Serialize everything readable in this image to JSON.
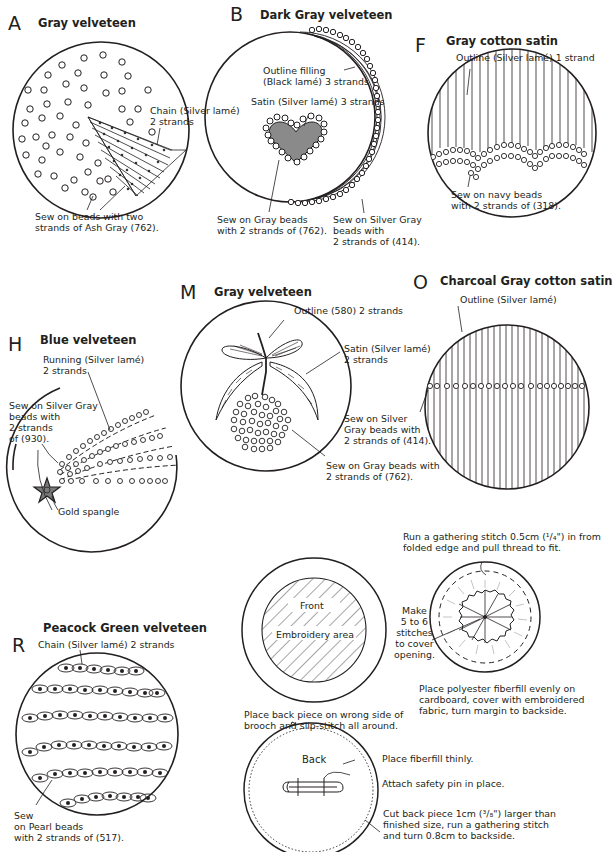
{
  "panels": {
    "A": {
      "letter": "A",
      "fabric": "Gray velveteen",
      "labels": {
        "chain": "Chain (Silver lamé)\n2 strands",
        "beads": "Sew on beads with two\nstrands of Ash Gray (762)."
      }
    },
    "B": {
      "letter": "B",
      "fabric": "Dark Gray velveteen",
      "labels": {
        "outline_filling": "Outline filling\n(Black lamé) 3 strands",
        "satin": "Satin (Silver lamé) 3 strands",
        "gray_beads": "Sew on Gray beads\nwith 2 strands of (762).",
        "silver_beads": "Sew on Silver Gray\nbeads with\n2 strands of (414)."
      }
    },
    "F": {
      "letter": "F",
      "fabric": "Gray cotton satin",
      "labels": {
        "outline": "Outline (Silver lamé) 1 strand",
        "beads": "Sew on navy beads\nwith 2 strands of (318)."
      }
    },
    "H": {
      "letter": "H",
      "fabric": "Blue velveteen",
      "labels": {
        "running": "Running (Silver lamé)\n2 strands",
        "beads": "Sew on Silver Gray\nbeads with\n2 strands\nof (930).",
        "spangle": "Gold spangle"
      }
    },
    "M": {
      "letter": "M",
      "fabric": "Gray velveteen",
      "labels": {
        "outline": "Outline (580) 2 strands",
        "satin": "Satin (Silver lamé)\n2 strands",
        "silver_beads": "Sew on Silver\nGray beads with\n2 strands of (414).",
        "gray_beads": "Sew on Gray beads with\n2 strands of (762)."
      }
    },
    "O": {
      "letter": "O",
      "fabric": "Charcoal Gray cotton satin",
      "labels": {
        "outline": "Outline (Silver lamé)"
      }
    },
    "R": {
      "letter": "R",
      "fabric": "Peacock Green velveteen",
      "labels": {
        "chain": "Chain (Silver lamé) 2 strands",
        "beads": "Sew\non Pearl beads\nwith 2 strands of (517)."
      }
    }
  },
  "assembly": {
    "front_label": "Front",
    "embroidery_area": "Embroidery area",
    "gathering": "Run a gathering stitch 0.5cm (¹/₄\") in from\nfolded edge and pull thread to fit.",
    "make_stitches": "Make\n5 to 6\nstitches\nto cover\nopening.",
    "fiberfill": "Place polyester fiberfill evenly on\ncardboard, cover with embroidered\nfabric, turn margin to backside.",
    "back_piece": "Place back piece on wrong side of\nbrooch and slip-stitch all around.",
    "back_label": "Back",
    "fiberfill_thin": "Place fiberfill thinly.",
    "safety_pin": "Attach safety pin in place.",
    "cut_back": "Cut back piece 1cm (³/₈\") larger than\nfinished size, run a gathering stitch\nand turn 0.8cm to backside."
  },
  "colors": {
    "line": "#231f20",
    "heart_fill": "#8a8a8a",
    "star_fill": "#7a7a7a",
    "bead_fill": "#ffffff"
  }
}
